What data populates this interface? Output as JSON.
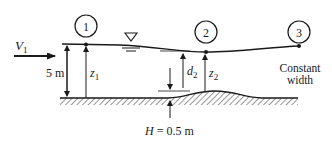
{
  "diagram": {
    "type": "open-channel-flow-over-bump",
    "stations": [
      {
        "id": "station-1",
        "label": "1"
      },
      {
        "id": "station-2",
        "label": "2"
      },
      {
        "id": "station-3",
        "label": "3"
      }
    ],
    "labels": {
      "velocity_symbol": "V",
      "velocity_subscript": "1",
      "upstream_depth": "5 m",
      "z1_symbol": "z",
      "z1_subscript": "1",
      "d2_symbol": "d",
      "d2_subscript": "2",
      "z2_symbol": "z",
      "z2_subscript": "2",
      "bump_height_symbol": "H",
      "bump_height_value": " = 0.5 m",
      "note_line1": "Constant",
      "note_line2": "width"
    },
    "colors": {
      "ink": "#1a1a1a",
      "background": "#ffffff"
    }
  }
}
